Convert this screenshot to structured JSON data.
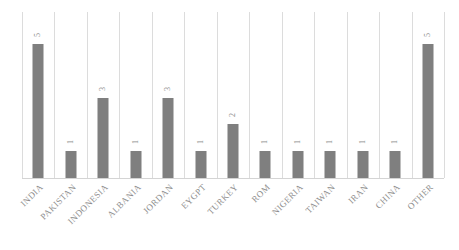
{
  "chart_data": {
    "type": "bar",
    "title": "",
    "subtitle": "",
    "xlabel": "",
    "ylabel": "",
    "ylim": [
      0,
      5
    ],
    "grid": "vertical-category-separators",
    "legend": "none",
    "orientation": "vertical",
    "data_labels_shown": true,
    "data_label_rotation": "90deg",
    "category_label_rotation": "45deg",
    "categories": [
      "INDIA",
      "PAKISTAN",
      "INDONESIA",
      "ALBANIA",
      "JORDAN",
      "EYGPT",
      "TURKEY",
      "ROM",
      "NIGERIA",
      "TAIWAN",
      "IRAN",
      "CHINA",
      "OTHER"
    ],
    "values": [
      5,
      1,
      3,
      1,
      3,
      1,
      2,
      1,
      1,
      1,
      1,
      1,
      5
    ],
    "value_labels": [
      "5",
      "1",
      "3",
      "1",
      "3",
      "1",
      "2",
      "1",
      "1",
      "1",
      "1",
      "1",
      "5"
    ],
    "colors": {
      "bar": "#7f7f7f",
      "gridline": "#dcdcdc",
      "axis_line": "#d4d4d4",
      "label_text": "#8d8d8d",
      "value_text": "#8a8a8a",
      "background": "#ffffff"
    }
  }
}
